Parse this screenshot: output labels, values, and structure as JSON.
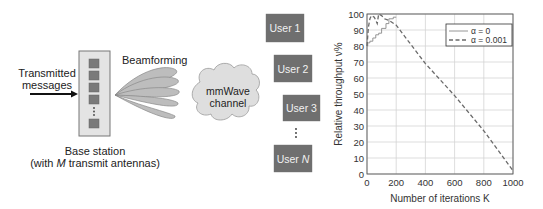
{
  "diagram": {
    "input_label_line1": "Transmitted",
    "input_label_line2": "messages",
    "beamforming_label": "Beamforming",
    "base_station_label_line1": "Base station",
    "base_station_label_line2_prefix": "(with ",
    "base_station_label_line2_var": "M",
    "base_station_label_line2_suffix": " transmit antennas)",
    "channel_label_line1": "mmWave",
    "channel_label_line2": "channel",
    "users": [
      {
        "label": "User 1"
      },
      {
        "label": "User 2"
      },
      {
        "label": "User 3"
      },
      {
        "label_prefix": "User ",
        "label_var": "N"
      }
    ],
    "antenna_count_shown": 5,
    "ellipsis": "⋮",
    "colors": {
      "antenna": "#7a7a7a",
      "base_station_fill": "#e4e4e4",
      "beam_fill": "#bdbdbd",
      "cloud_fill": "#dedede",
      "user_box": "#6f6f6f"
    }
  },
  "chart_data": {
    "type": "line",
    "title": "",
    "xlabel": "Number of iterations K",
    "ylabel": "Relative throughput ν%",
    "xlim": [
      0,
      1000
    ],
    "ylim": [
      0,
      100
    ],
    "xticks": [
      0,
      200,
      400,
      600,
      800,
      1000
    ],
    "yticks": [
      0,
      10,
      20,
      30,
      40,
      50,
      60,
      70,
      80,
      90,
      100
    ],
    "grid": true,
    "legend_position": "upper right",
    "series": [
      {
        "name": "α = 0",
        "style": "solid",
        "x": [
          0,
          5,
          10,
          20,
          40,
          60,
          80,
          100,
          130,
          150,
          180,
          200
        ],
        "y": [
          80,
          82,
          82,
          83,
          85,
          87,
          88,
          91,
          94,
          97,
          98,
          98
        ]
      },
      {
        "name": "α = 0.001",
        "style": "dashed",
        "x": [
          0,
          10,
          20,
          30,
          50,
          70,
          80,
          100,
          120,
          150,
          200,
          400,
          500,
          600,
          800,
          1000
        ],
        "y": [
          80,
          92,
          97,
          99,
          98,
          94,
          100,
          99,
          97,
          96,
          93,
          69,
          59,
          49,
          27,
          2
        ]
      }
    ],
    "legend": [
      "α = 0",
      "α = 0.001"
    ]
  }
}
